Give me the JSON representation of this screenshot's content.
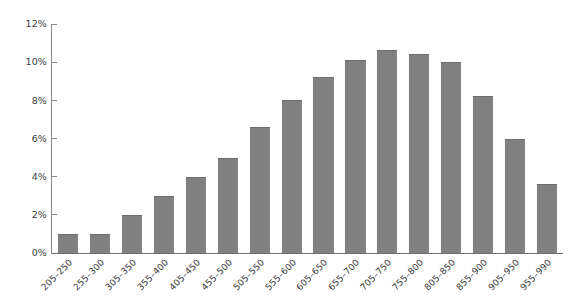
{
  "chart_data": {
    "type": "bar",
    "title": "",
    "subtitle": "",
    "xlabel": "",
    "ylabel": "",
    "categories": [
      "205–250",
      "255–300",
      "305–350",
      "355–400",
      "405–450",
      "455–500",
      "505–550",
      "555–600",
      "605–650",
      "655–700",
      "705–750",
      "755–800",
      "805–850",
      "855–900",
      "905–950",
      "955–990"
    ],
    "values": [
      1.0,
      1.0,
      2.0,
      3.0,
      4.0,
      5.0,
      6.6,
      8.0,
      9.2,
      10.1,
      10.65,
      10.45,
      10.0,
      8.25,
      6.0,
      3.6
    ],
    "ylim": [
      0,
      12
    ],
    "ytick_values": [
      0,
      2,
      4,
      6,
      8,
      10,
      12
    ],
    "ytick_labels": [
      "0%",
      "2%",
      "4%",
      "6%",
      "8%",
      "10%",
      "12%"
    ],
    "grid": false,
    "legend": null,
    "bar_color": "#808080",
    "axis_color": "#8a8a8a",
    "baseline_color": "#6e6e6e",
    "text_color": "#3c3c3c",
    "background_color": "#ffffff",
    "xtick_label_rotation_deg": -45
  }
}
